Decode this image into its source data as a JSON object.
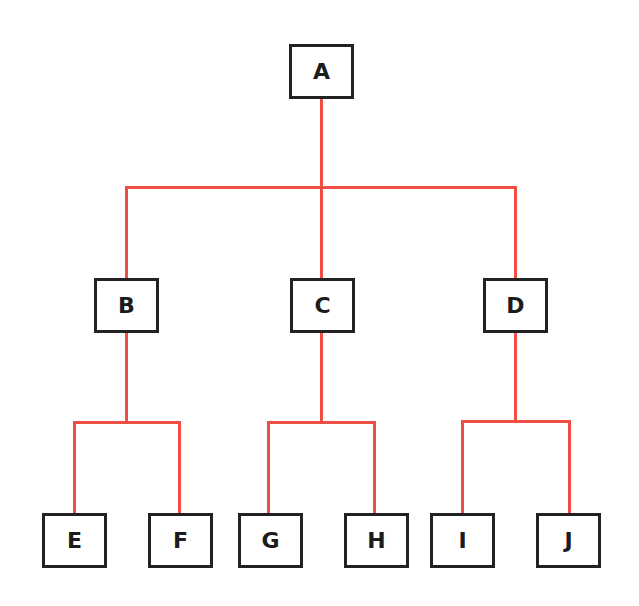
{
  "diagram": {
    "type": "tree",
    "colors": {
      "edge": "#ee4e44",
      "node_border": "#222222",
      "node_text": "#1c1c1c",
      "background": "#ffffff"
    },
    "nodes": [
      {
        "id": "A",
        "label": "A",
        "x": 289,
        "y": 44
      },
      {
        "id": "B",
        "label": "B",
        "x": 94,
        "y": 278
      },
      {
        "id": "C",
        "label": "C",
        "x": 290,
        "y": 278
      },
      {
        "id": "D",
        "label": "D",
        "x": 483,
        "y": 278
      },
      {
        "id": "E",
        "label": "E",
        "x": 42,
        "y": 513
      },
      {
        "id": "F",
        "label": "F",
        "x": 148,
        "y": 513
      },
      {
        "id": "G",
        "label": "G",
        "x": 238,
        "y": 513
      },
      {
        "id": "H",
        "label": "H",
        "x": 344,
        "y": 513
      },
      {
        "id": "I",
        "label": "I",
        "x": 430,
        "y": 513
      },
      {
        "id": "J",
        "label": "J",
        "x": 536,
        "y": 513
      }
    ],
    "edges": [
      [
        "A",
        "B"
      ],
      [
        "A",
        "C"
      ],
      [
        "A",
        "D"
      ],
      [
        "B",
        "E"
      ],
      [
        "B",
        "F"
      ],
      [
        "C",
        "G"
      ],
      [
        "C",
        "H"
      ],
      [
        "D",
        "I"
      ],
      [
        "D",
        "J"
      ]
    ]
  }
}
